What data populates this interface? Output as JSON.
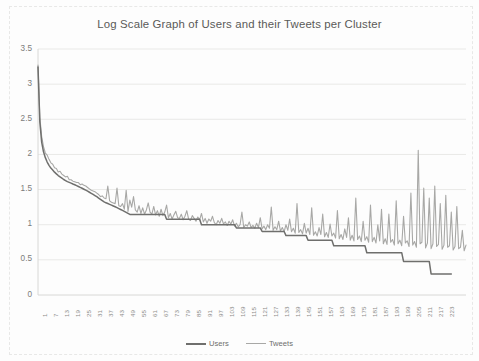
{
  "chart_data": {
    "type": "line",
    "title": "Log Scale Graph of Users and their Tweets per Cluster",
    "xlabel": "",
    "ylabel": "",
    "ylim": [
      0,
      3.5
    ],
    "xlim": [
      1,
      226
    ],
    "grid": true,
    "legend_position": "bottom",
    "yticks": [
      "0",
      "0.5",
      "1",
      "1.5",
      "2",
      "2.5",
      "3",
      "3.5"
    ],
    "ytick_values": [
      0,
      0.5,
      1,
      1.5,
      2,
      2.5,
      3,
      3.5
    ],
    "xticks": [
      "1",
      "7",
      "13",
      "19",
      "25",
      "31",
      "37",
      "43",
      "49",
      "55",
      "61",
      "67",
      "73",
      "79",
      "85",
      "91",
      "97",
      "103",
      "109",
      "115",
      "121",
      "127",
      "133",
      "139",
      "145",
      "151",
      "157",
      "163",
      "169",
      "175",
      "181",
      "187",
      "193",
      "199",
      "205",
      "211",
      "217",
      "223"
    ],
    "xtick_step": 6,
    "colors": {
      "users": "#6f6f6d",
      "tweets": "#a8a8a6",
      "grid": "#e9e9e7",
      "axis": "#d8d8d6",
      "title": "#5a5a58"
    },
    "series": [
      {
        "name": "Users",
        "color": "#6f6f6d",
        "width": 1.5,
        "values": [
          3.243,
          2.462,
          2.176,
          2.037,
          1.954,
          1.892,
          1.845,
          1.806,
          1.778,
          1.748,
          1.724,
          1.699,
          1.681,
          1.663,
          1.643,
          1.628,
          1.613,
          1.602,
          1.591,
          1.579,
          1.568,
          1.556,
          1.544,
          1.531,
          1.519,
          1.505,
          1.491,
          1.477,
          1.462,
          1.447,
          1.431,
          1.415,
          1.398,
          1.38,
          1.362,
          1.344,
          1.326,
          1.312,
          1.301,
          1.29,
          1.279,
          1.267,
          1.255,
          1.243,
          1.23,
          1.217,
          1.204,
          1.19,
          1.176,
          1.161,
          1.146,
          1.146,
          1.146,
          1.146,
          1.146,
          1.146,
          1.146,
          1.146,
          1.146,
          1.146,
          1.146,
          1.146,
          1.146,
          1.146,
          1.146,
          1.146,
          1.146,
          1.146,
          1.146,
          1.146,
          1.079,
          1.079,
          1.079,
          1.079,
          1.079,
          1.079,
          1.079,
          1.079,
          1.079,
          1.079,
          1.079,
          1.079,
          1.079,
          1.079,
          1.079,
          1.079,
          1.079,
          1.079,
          1.079,
          1.0,
          1.0,
          1.0,
          1.0,
          1.0,
          1.0,
          1.0,
          1.0,
          1.0,
          1.0,
          1.0,
          1.0,
          1.0,
          1.0,
          1.0,
          1.0,
          1.0,
          1.0,
          1.0,
          0.954,
          0.954,
          0.954,
          0.954,
          0.954,
          0.954,
          0.954,
          0.954,
          0.954,
          0.954,
          0.954,
          0.954,
          0.954,
          0.954,
          0.903,
          0.903,
          0.903,
          0.903,
          0.903,
          0.903,
          0.903,
          0.903,
          0.903,
          0.903,
          0.903,
          0.903,
          0.903,
          0.845,
          0.845,
          0.845,
          0.845,
          0.845,
          0.845,
          0.845,
          0.845,
          0.845,
          0.845,
          0.845,
          0.845,
          0.778,
          0.778,
          0.778,
          0.778,
          0.778,
          0.778,
          0.778,
          0.778,
          0.778,
          0.778,
          0.778,
          0.778,
          0.778,
          0.778,
          0.7,
          0.7,
          0.7,
          0.7,
          0.7,
          0.7,
          0.7,
          0.7,
          0.7,
          0.7,
          0.7,
          0.7,
          0.7,
          0.7,
          0.7,
          0.7,
          0.7,
          0.7,
          0.602,
          0.602,
          0.602,
          0.602,
          0.602,
          0.602,
          0.602,
          0.602,
          0.602,
          0.602,
          0.602,
          0.602,
          0.602,
          0.602,
          0.602,
          0.602,
          0.602,
          0.602,
          0.602,
          0.602,
          0.477,
          0.477,
          0.477,
          0.477,
          0.477,
          0.477,
          0.477,
          0.477,
          0.477,
          0.477,
          0.477,
          0.477,
          0.477,
          0.477,
          0.477,
          0.3,
          0.3,
          0.3,
          0.3,
          0.3,
          0.3,
          0.3,
          0.3,
          0.3,
          0.3,
          0.3,
          0.3
        ]
      },
      {
        "name": "Tweets",
        "color": "#a8a8a6",
        "width": 1.1,
        "values": [
          3.272,
          2.53,
          2.255,
          2.11,
          2.02,
          1.99,
          1.93,
          1.88,
          1.86,
          1.81,
          1.8,
          1.75,
          1.76,
          1.72,
          1.7,
          1.68,
          1.69,
          1.64,
          1.64,
          1.62,
          1.61,
          1.6,
          1.6,
          1.57,
          1.58,
          1.56,
          1.55,
          1.53,
          1.51,
          1.49,
          1.48,
          1.47,
          1.45,
          1.43,
          1.4,
          1.41,
          1.38,
          1.37,
          1.55,
          1.34,
          1.32,
          1.31,
          1.3,
          1.52,
          1.27,
          1.26,
          1.3,
          1.22,
          1.49,
          1.19,
          1.35,
          1.25,
          1.4,
          1.21,
          1.18,
          1.27,
          1.16,
          1.24,
          1.15,
          1.21,
          1.31,
          1.18,
          1.15,
          1.26,
          1.14,
          1.2,
          1.12,
          1.22,
          1.13,
          1.18,
          1.28,
          1.1,
          1.16,
          1.08,
          1.14,
          1.19,
          1.1,
          1.09,
          1.15,
          1.07,
          1.12,
          1.2,
          1.08,
          1.06,
          1.13,
          1.09,
          1.05,
          1.11,
          1.07,
          1.16,
          1.04,
          1.09,
          1.02,
          1.08,
          1.05,
          1.12,
          1.03,
          1.0,
          1.06,
          1.02,
          1.09,
          1.01,
          1.04,
          0.99,
          1.05,
          1.01,
          1.07,
          0.98,
          1.02,
          0.97,
          1.0,
          1.18,
          0.96,
          1.0,
          0.98,
          1.04,
          0.96,
          0.99,
          0.95,
          1.02,
          0.96,
          1.1,
          0.94,
          0.98,
          0.93,
          1.0,
          0.95,
          1.25,
          0.92,
          0.97,
          0.93,
          1.05,
          0.91,
          0.96,
          0.9,
          1.0,
          0.92,
          1.08,
          0.9,
          0.95,
          0.88,
          1.3,
          0.89,
          0.93,
          0.87,
          1.02,
          0.88,
          0.95,
          0.86,
          1.24,
          0.85,
          0.9,
          0.84,
          0.96,
          0.86,
          1.15,
          0.83,
          0.89,
          0.82,
          1.01,
          0.84,
          0.88,
          0.81,
          1.2,
          0.8,
          0.86,
          0.79,
          0.94,
          0.82,
          1.1,
          0.78,
          0.85,
          0.77,
          1.38,
          0.79,
          0.84,
          0.76,
          1.05,
          0.78,
          0.83,
          0.75,
          1.28,
          0.76,
          0.82,
          0.74,
          1.0,
          0.77,
          1.22,
          0.73,
          0.8,
          0.72,
          1.15,
          0.75,
          0.79,
          0.71,
          1.34,
          0.73,
          0.78,
          0.7,
          1.12,
          0.74,
          0.77,
          0.69,
          1.45,
          0.71,
          0.76,
          0.68,
          2.06,
          0.73,
          0.75,
          1.52,
          0.67,
          0.74,
          1.38,
          0.66,
          0.73,
          1.55,
          0.69,
          0.72,
          1.3,
          0.65,
          0.71,
          1.42,
          0.68,
          0.7,
          1.18,
          0.64,
          0.69,
          1.26,
          0.66,
          0.68,
          0.92,
          0.63,
          0.71
        ]
      }
    ]
  },
  "legend": {
    "entries": [
      {
        "label": "Users"
      },
      {
        "label": "Tweets"
      }
    ]
  }
}
